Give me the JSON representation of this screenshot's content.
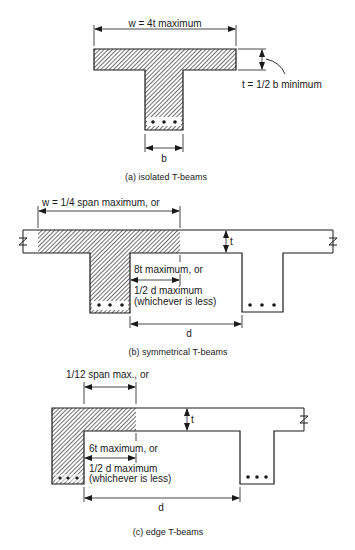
{
  "figures": [
    {
      "id": "a",
      "caption": "(a) isolated T-beams",
      "labels": {
        "width": "w = 4t maximum",
        "thickness": "t = 1/2 b minimum",
        "web": "b"
      }
    },
    {
      "id": "b",
      "caption": "(b) symmetrical T-beams",
      "labels": {
        "width": "w = 1/4 span  maximum, or",
        "thickness": "t",
        "overhang_line1": "8t maximum, or",
        "overhang_line2": "1/2 d maximum",
        "overhang_line3": "(whichever is less)",
        "spacing": "d"
      }
    },
    {
      "id": "c",
      "caption": "(c) edge T-beams",
      "labels": {
        "width": "1/12 span max., or",
        "thickness": "t",
        "overhang_line1": "6t maximum, or",
        "overhang_line2": "1/2 d maximum",
        "overhang_line3": "(whichever is less)",
        "spacing": "d"
      }
    }
  ],
  "colors": {
    "line": "#1a1a1a",
    "hatch": "#333333",
    "background": "#ffffff"
  }
}
